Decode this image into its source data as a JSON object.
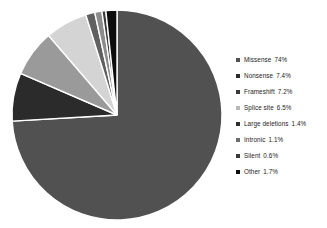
{
  "chart_data": {
    "type": "pie",
    "title": "",
    "subtitle": "",
    "xlabel": "",
    "ylabel": "",
    "legend_position": "right",
    "grid": false,
    "start_angle_deg": 0,
    "direction": "clockwise",
    "categories": [
      "Missense",
      "Nonsense",
      "Frameshift",
      "Splice site",
      "Large deletions",
      "Intronic",
      "Silent",
      "Other"
    ],
    "values": [
      74,
      7.4,
      7.2,
      6.5,
      1.4,
      1.1,
      0.6,
      1.7
    ],
    "value_labels": [
      "74%",
      "7.4%",
      "7.2%",
      "6.5%",
      "1.4%",
      "1.1%",
      "0.6%",
      "1.7%"
    ],
    "colors": [
      "#515151",
      "#2b2b2b",
      "#9a9a9a",
      "#d4d4d4",
      "#606060",
      "#8c8c8c",
      "#3a3a3a",
      "#0d0d0d"
    ],
    "slice_separator_color": "#ffffff",
    "units": "percent"
  },
  "legend": {
    "items": [
      {
        "label": "Missense",
        "value": "74%",
        "color": "#515151",
        "marker": "square-marker"
      },
      {
        "label": "Nonsense",
        "value": "7.4%",
        "color": "#2b2b2b",
        "marker": "square-marker"
      },
      {
        "label": "Frameshift",
        "value": "7.2%",
        "color": "#3a3a3a",
        "marker": "square-marker"
      },
      {
        "label": "Splice site",
        "value": "6.5%",
        "color": "#b8b8b8",
        "marker": "square-marker"
      },
      {
        "label": "Large deletions",
        "value": "1.4%",
        "color": "#2e2e2e",
        "marker": "square-marker"
      },
      {
        "label": "Intronic",
        "value": "1.1%",
        "color": "#6e6e6e",
        "marker": "square-marker"
      },
      {
        "label": "Silent",
        "value": "0.6%",
        "color": "#3a3a3a",
        "marker": "square-marker"
      },
      {
        "label": "Other",
        "value": "1.7%",
        "color": "#0d0d0d",
        "marker": "square-marker"
      }
    ]
  }
}
